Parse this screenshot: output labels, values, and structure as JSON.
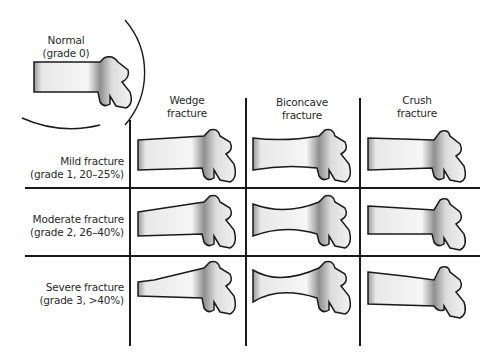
{
  "diagram": {
    "normal": {
      "title": "Normal",
      "subtitle": "(grade 0)"
    },
    "columns": [
      {
        "line1": "Wedge",
        "line2": "fracture"
      },
      {
        "line1": "Biconcave",
        "line2": "fracture"
      },
      {
        "line1": "Crush",
        "line2": "fracture"
      }
    ],
    "rows": [
      {
        "line1": "Mild fracture",
        "line2": "(grade 1, 20–25%)"
      },
      {
        "line1": "Moderate fracture",
        "line2": "(grade 2, 26–40%)"
      },
      {
        "line1": "Severe fracture",
        "line2": "(grade 3, >40%)"
      }
    ],
    "colors": {
      "outline": "#1a1a1a",
      "shade": "#8a8a8a",
      "fill": "#f7f7f7"
    }
  }
}
